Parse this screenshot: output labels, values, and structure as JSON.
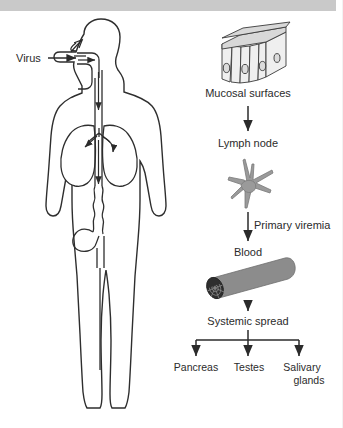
{
  "figure": {
    "banner_color": "#c9c9c9",
    "background_color": "#ffffff",
    "text_color": "#2b2b2b",
    "outline_color": "#2e2e2e"
  },
  "body_diagram": {
    "name": "human body silhouette",
    "entry_label": "Virus",
    "entry_arrow": "arrow pointing right into the mouth",
    "organs": [
      "nasal passage",
      "oral cavity",
      "trachea",
      "left lung",
      "right lung",
      "esophagus",
      "stomach",
      "intestine"
    ]
  },
  "flow": {
    "steps": [
      {
        "id": "mucosal",
        "label": "Mucosal surfaces",
        "icon": "epithelium-block-icon"
      },
      {
        "id": "lymph",
        "label": "Lymph node",
        "icon": "lymph-node-icon"
      },
      {
        "id": "blood",
        "label": "Blood",
        "icon": "blood-vessel-icon"
      },
      {
        "id": "spread",
        "label": "Systemic spread",
        "icon": "branch-icon"
      }
    ],
    "arrow_labels": {
      "to_lymph": "",
      "to_blood": "Primary viremia"
    },
    "targets": [
      {
        "label": "Pancreas"
      },
      {
        "label": "Testes"
      },
      {
        "label_line1": "Salivary",
        "label_line2": "glands"
      }
    ]
  },
  "colors": {
    "cell_face": "#efefef",
    "cell_top": "#d8d8d8",
    "lymph_node": "#9a9a9a",
    "vessel": "#8c8c8c",
    "vessel_lumen": "#2e2e2e"
  }
}
